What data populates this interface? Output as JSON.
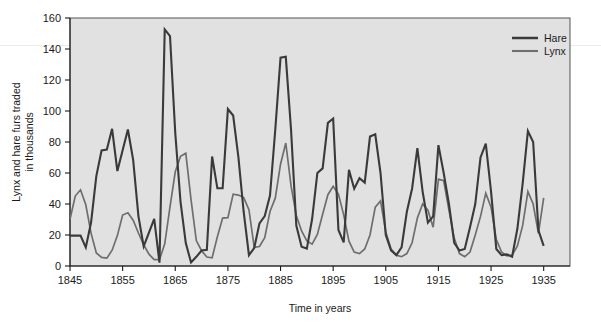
{
  "chart_data": {
    "type": "line",
    "title": "",
    "subtitle": "",
    "xlabel": "Time in years",
    "ylabel": "Lynx and hare furs traded in thousands",
    "ylabel_line1": "Lynx and hare furs traded",
    "ylabel_line2": "in thousands",
    "xlim": [
      1845,
      1940
    ],
    "ylim": [
      0,
      160
    ],
    "xticks": [
      1845,
      1855,
      1865,
      1875,
      1885,
      1895,
      1905,
      1915,
      1925,
      1935
    ],
    "xtick_labels": [
      "1845",
      "1855",
      "1865",
      "1875",
      "1885",
      "1895",
      "1905",
      "1915",
      "1925",
      "1935"
    ],
    "yticks": [
      0,
      20,
      40,
      60,
      80,
      100,
      120,
      140,
      160
    ],
    "ytick_labels": [
      "0",
      "20",
      "40",
      "60",
      "80",
      "100",
      "120",
      "140",
      "160"
    ],
    "grid": false,
    "plot_background": "#e1e1e1",
    "legend_position": "top-right",
    "x": [
      1845,
      1846,
      1847,
      1848,
      1849,
      1850,
      1851,
      1852,
      1853,
      1854,
      1855,
      1856,
      1857,
      1858,
      1859,
      1860,
      1861,
      1862,
      1863,
      1864,
      1865,
      1866,
      1867,
      1868,
      1869,
      1870,
      1871,
      1872,
      1873,
      1874,
      1875,
      1876,
      1877,
      1878,
      1879,
      1880,
      1881,
      1882,
      1883,
      1884,
      1885,
      1886,
      1887,
      1888,
      1889,
      1890,
      1891,
      1892,
      1893,
      1894,
      1895,
      1896,
      1897,
      1898,
      1899,
      1900,
      1901,
      1902,
      1903,
      1904,
      1905,
      1906,
      1907,
      1908,
      1909,
      1910,
      1911,
      1912,
      1913,
      1914,
      1915,
      1916,
      1917,
      1918,
      1919,
      1920,
      1921,
      1922,
      1923,
      1924,
      1925,
      1926,
      1927,
      1928,
      1929,
      1930,
      1931,
      1932,
      1933,
      1934,
      1935
    ],
    "series": [
      {
        "name": "Hare",
        "color": "#3a3a3a",
        "line_width": 2.1,
        "values": [
          19.58,
          19.6,
          19.61,
          11.99,
          28.04,
          58.0,
          74.6,
          75.09,
          88.48,
          61.28,
          74.67,
          88.06,
          68.51,
          32.19,
          12.64,
          21.49,
          30.35,
          2.18,
          152.65,
          148.36,
          85.81,
          41.41,
          14.75,
          2.28,
          5.91,
          9.95,
          10.44,
          70.64,
          50.12,
          50.13,
          101.25,
          97.12,
          70.14,
          34.85,
          7.0,
          11.61,
          27.53,
          32.18,
          45.4,
          87.9,
          134.42,
          134.95,
          87.77,
          26.12,
          12.48,
          11.22,
          30.32,
          60.06,
          62.98,
          92.37,
          95.13,
          23.29,
          15.22,
          62.0,
          49.89,
          56.62,
          53.79,
          83.53,
          85.0,
          60.0,
          20.0,
          10.1,
          7.0,
          12.0,
          35.0,
          50.0,
          76.0,
          48.0,
          28.0,
          32.0,
          78.0,
          60.0,
          40.0,
          15.0,
          10.0,
          11.0,
          25.0,
          40.0,
          70.0,
          79.0,
          48.0,
          11.0,
          7.0,
          7.5,
          6.0,
          24.0,
          53.0,
          87.0,
          80.0,
          23.0,
          13.0
        ],
        "peaks": [
          {
            "year": 1863,
            "value": 152.65
          },
          {
            "year": 1885,
            "value": 134.42
          },
          {
            "year": 1886,
            "value": 134.95
          },
          {
            "year": 1875,
            "value": 101.25
          }
        ]
      },
      {
        "name": "Lynx",
        "color": "#6e6e6e",
        "line_width": 1.7,
        "values": [
          30.09,
          45.15,
          49.15,
          39.52,
          21.23,
          8.42,
          5.56,
          5.08,
          10.17,
          19.6,
          32.91,
          34.38,
          29.59,
          21.3,
          13.69,
          7.65,
          4.08,
          4.09,
          14.33,
          38.22,
          60.78,
          70.77,
          72.77,
          42.68,
          16.39,
          9.83,
          5.8,
          5.26,
          18.91,
          30.95,
          31.18,
          46.34,
          45.77,
          44.15,
          36.33,
          12.03,
          12.6,
          18.34,
          35.14,
          43.77,
          65.69,
          79.35,
          51.65,
          32.59,
          22.58,
          16.16,
          14.12,
          20.38,
          33.33,
          46.0,
          51.4,
          46.4,
          33.0,
          16.0,
          9.0,
          8.0,
          11.0,
          20.0,
          38.0,
          42.0,
          22.0,
          11.0,
          7.0,
          6.0,
          8.0,
          15.0,
          31.0,
          40.0,
          36.0,
          25.0,
          56.0,
          55.0,
          36.0,
          18.0,
          8.0,
          6.0,
          9.0,
          20.0,
          32.0,
          47.0,
          38.0,
          17.0,
          9.0,
          6.5,
          7.0,
          13.0,
          26.0,
          48.0,
          40.0,
          21.0,
          44.0
        ],
        "peaks": [
          {
            "year": 1886,
            "value": 79.35
          },
          {
            "year": 1867,
            "value": 72.77
          },
          {
            "year": 1915,
            "value": 56.0
          }
        ]
      }
    ]
  },
  "legend": {
    "entries": [
      {
        "label": "Hare"
      },
      {
        "label": "Lynx"
      }
    ]
  }
}
